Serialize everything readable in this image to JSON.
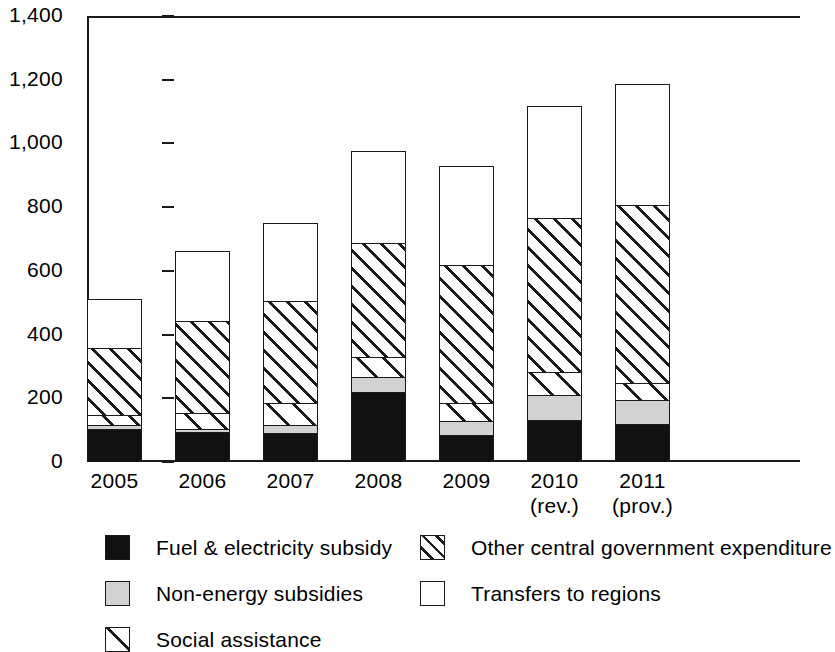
{
  "chart_data": {
    "type": "bar",
    "stacked": true,
    "title": "",
    "subtitle": "",
    "xlabel": "",
    "ylabel": "",
    "ylim": [
      0,
      1400
    ],
    "ytick_step": 200,
    "ytick_labels": [
      "0",
      "200",
      "400",
      "600",
      "800",
      "1,000",
      "1,200",
      "1,400"
    ],
    "ytick_values": [
      0,
      200,
      400,
      600,
      800,
      1000,
      1200,
      1400
    ],
    "grid": false,
    "legend_position": "bottom",
    "categories": [
      "2005",
      "2006",
      "2007",
      "2008",
      "2009",
      "2010 (rev.)",
      "2011 (prov.)"
    ],
    "category_labels": [
      {
        "main": "2005",
        "sub": ""
      },
      {
        "main": "2006",
        "sub": ""
      },
      {
        "main": "2007",
        "sub": ""
      },
      {
        "main": "2008",
        "sub": ""
      },
      {
        "main": "2009",
        "sub": ""
      },
      {
        "main": "2010",
        "sub": "(rev.)"
      },
      {
        "main": "2011",
        "sub": "(prov.)"
      }
    ],
    "series": [
      {
        "name": "Fuel & electricity subsidy",
        "pattern": "solid-black",
        "color": "#111111",
        "values": [
          105,
          95,
          92,
          220,
          85,
          132,
          120
        ]
      },
      {
        "name": "Non-energy subsidies",
        "pattern": "solid-gray",
        "color": "#d2d2d2",
        "values": [
          12,
          10,
          25,
          48,
          44,
          78,
          75
        ]
      },
      {
        "name": "Social assistance",
        "pattern": "sparse-diagonal-hatch",
        "color": "#ffffff",
        "values": [
          31,
          48,
          68,
          62,
          56,
          72,
          53
        ]
      },
      {
        "name": "Other central government expenditure",
        "pattern": "dense-diagonal-hatch",
        "color": "#ffffff",
        "values": [
          211,
          289,
          320,
          358,
          435,
          484,
          560
        ]
      },
      {
        "name": "Transfers to regions",
        "pattern": "solid-white",
        "color": "#ffffff",
        "values": [
          152,
          221,
          245,
          287,
          308,
          352,
          378
        ]
      }
    ],
    "totals": [
      511,
      663,
      750,
      975,
      928,
      1118,
      1186
    ],
    "stack_tops": {
      "2005": [
        105,
        117,
        148,
        359,
        511
      ],
      "2006": [
        95,
        105,
        153,
        442,
        663
      ],
      "2007": [
        92,
        117,
        185,
        505,
        750
      ],
      "2008": [
        220,
        268,
        330,
        688,
        975
      ],
      "2009": [
        85,
        129,
        185,
        620,
        928
      ],
      "2010 (rev.)": [
        132,
        210,
        282,
        766,
        1118
      ],
      "2011 (prov.)": [
        120,
        195,
        248,
        808,
        1186
      ]
    }
  },
  "legend": {
    "items": [
      {
        "label": "Fuel & electricity subsidy",
        "swatch": "solid-black-swatch"
      },
      {
        "label": "Other central government expenditure",
        "swatch": "dense-hatch-swatch"
      },
      {
        "label": "Non-energy subsidies",
        "swatch": "solid-gray-swatch"
      },
      {
        "label": "Transfers to regions",
        "swatch": "solid-white-swatch"
      },
      {
        "label": "Social assistance",
        "swatch": "sparse-hatch-swatch"
      }
    ]
  },
  "colors": {
    "axis": "#1a1a1a",
    "black_fill": "#111111",
    "gray_fill": "#d2d2d2",
    "white_fill": "#ffffff",
    "background": "#ffffff"
  }
}
